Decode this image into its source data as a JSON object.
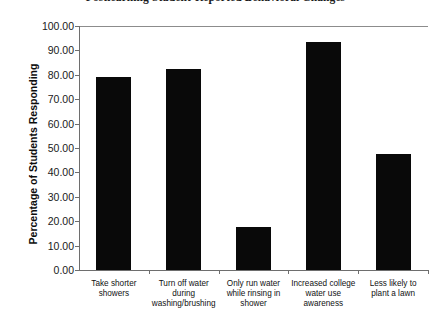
{
  "chart_data": {
    "type": "bar",
    "title": "Postlearning Student-Reported Behavioral Changes",
    "xlabel": "",
    "ylabel": "Percentage of Students Responding",
    "categories": [
      "Take shorter showers",
      "Turn off water during washing/brushing",
      "Only run water while rinsing in shower",
      "Increased college water use awareness",
      "Less likely to plant a lawn"
    ],
    "category_lines": [
      [
        "Take shorter",
        "showers"
      ],
      [
        "Turn off water",
        "during",
        "washing/brushing"
      ],
      [
        "Only run water",
        "while rinsing in",
        "shower"
      ],
      [
        "Increased college",
        "water use",
        "awareness"
      ],
      [
        "Less likely to",
        "plant a lawn"
      ]
    ],
    "values": [
      79.0,
      82.5,
      17.5,
      93.5,
      47.5
    ],
    "ylim": [
      0,
      100
    ],
    "ytick_step": 10,
    "ytick_labels": [
      "0.00",
      "10.00",
      "20.00",
      "30.00",
      "40.00",
      "50.00",
      "60.00",
      "70.00",
      "80.00",
      "90.00",
      "100.00"
    ],
    "grid": false,
    "legend": null,
    "bar_color": "#090909",
    "axis_color": "#6e6e6e"
  }
}
